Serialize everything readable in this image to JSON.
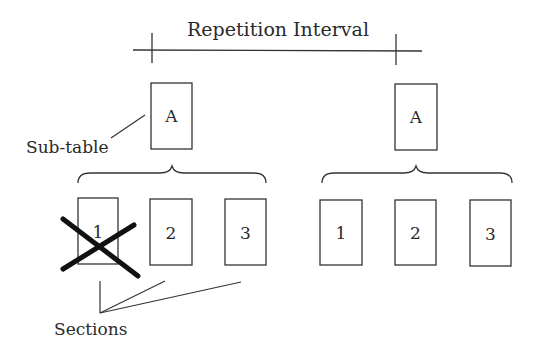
{
  "diagram": {
    "title": "Repetition Interval",
    "labels": {
      "subtable": "Sub-table",
      "sections": "Sections"
    },
    "groups": [
      {
        "subtable_label": "A",
        "sections": [
          "1",
          "2",
          "3"
        ],
        "crossed_out_section": "1"
      },
      {
        "subtable_label": "A",
        "sections": [
          "1",
          "2",
          "3"
        ],
        "crossed_out_section": null
      }
    ],
    "colors": {
      "stroke": "#333333",
      "text": "#2a2a2a",
      "cross": "#111111",
      "background": "#ffffff"
    }
  }
}
